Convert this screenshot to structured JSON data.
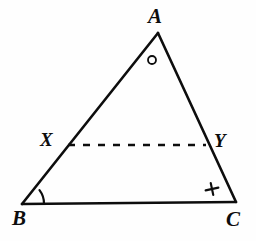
{
  "figure": {
    "kind": "geometry-diagram",
    "background_color": "#fefefe",
    "ink_color": "#0d0d0d",
    "canvas": {
      "width": 256,
      "height": 241
    },
    "labels": {
      "apex": "A",
      "bottom_left": "B",
      "bottom_right": "C",
      "left_midpoint": "X",
      "right_midpoint": "Y"
    },
    "points": {
      "A": {
        "x": 158,
        "y": 33
      },
      "B": {
        "x": 22,
        "y": 204
      },
      "C": {
        "x": 236,
        "y": 202
      },
      "X": {
        "x": 68,
        "y": 145
      },
      "Y": {
        "x": 206,
        "y": 145
      }
    },
    "segments": [
      {
        "name": "side-AB",
        "from": "A",
        "to": "B",
        "style": "solid",
        "width": 2.6
      },
      {
        "name": "side-AC",
        "from": "A",
        "to": "C",
        "style": "solid",
        "width": 2.6
      },
      {
        "name": "side-BC",
        "from": "B",
        "to": "C",
        "style": "solid",
        "width": 2.6
      },
      {
        "name": "segment-XY",
        "from": "X",
        "to": "Y",
        "style": "dashed",
        "width": 2.6
      }
    ],
    "marks": {
      "angle_b_arc": {
        "name": "angle-arc-at-b",
        "vertex": "B",
        "radius": 22,
        "width": 2.2
      },
      "circle_mark": {
        "name": "circle-angle-mark",
        "glyph": "circle",
        "cx": 152,
        "cy": 60,
        "r": 4,
        "width": 1.8
      },
      "cross_mark": {
        "name": "cross-angle-mark",
        "glyph": "plus",
        "cx": 212,
        "cy": 189,
        "arm": 6,
        "rotation_deg": -12,
        "width": 2.2
      }
    },
    "dash": {
      "dash_length": 7,
      "gap_length": 8
    }
  }
}
